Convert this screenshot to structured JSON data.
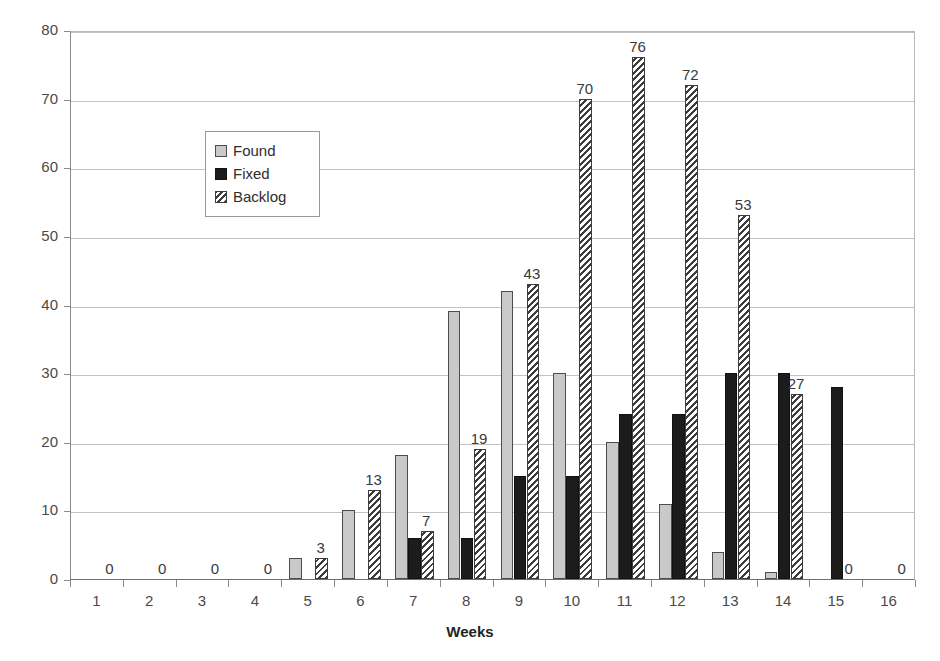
{
  "chart_data": {
    "type": "bar",
    "title": "",
    "xlabel": "Weeks",
    "ylabel": "Number of Defects",
    "categories": [
      "1",
      "2",
      "3",
      "4",
      "5",
      "6",
      "7",
      "8",
      "9",
      "10",
      "11",
      "12",
      "13",
      "14",
      "15",
      "16"
    ],
    "ylim": [
      0,
      80
    ],
    "yticks": [
      0,
      10,
      20,
      30,
      40,
      50,
      60,
      70,
      80
    ],
    "grid": true,
    "legend_position": "upper-left-inside",
    "series": [
      {
        "name": "Found",
        "color": "#c9c9c9",
        "pattern": "solid-light",
        "values": [
          0,
          0,
          0,
          0,
          3,
          10,
          18,
          39,
          42,
          30,
          20,
          11,
          4,
          1,
          0,
          0
        ]
      },
      {
        "name": "Fixed",
        "color": "#1c1c1c",
        "pattern": "solid-dark",
        "values": [
          0,
          0,
          0,
          0,
          0,
          0,
          6,
          6,
          15,
          15,
          24,
          24,
          30,
          30,
          28,
          0
        ]
      },
      {
        "name": "Backlog",
        "color": "#3c3c3c",
        "pattern": "diagonal-hatch",
        "values": [
          0,
          0,
          0,
          0,
          3,
          13,
          7,
          19,
          43,
          70,
          76,
          72,
          53,
          27,
          0,
          0
        ]
      }
    ],
    "annotations": [
      {
        "category": "1",
        "text": "0",
        "series": "Backlog"
      },
      {
        "category": "2",
        "text": "0",
        "series": "Backlog"
      },
      {
        "category": "3",
        "text": "0",
        "series": "Backlog"
      },
      {
        "category": "4",
        "text": "0",
        "series": "Backlog"
      },
      {
        "category": "5",
        "text": "3",
        "series": "Backlog"
      },
      {
        "category": "6",
        "text": "13",
        "series": "Backlog"
      },
      {
        "category": "7",
        "text": "7",
        "series": "Backlog"
      },
      {
        "category": "8",
        "text": "19",
        "series": "Backlog"
      },
      {
        "category": "9",
        "text": "43",
        "series": "Backlog"
      },
      {
        "category": "10",
        "text": "70",
        "series": "Backlog"
      },
      {
        "category": "11",
        "text": "76",
        "series": "Backlog"
      },
      {
        "category": "12",
        "text": "72",
        "series": "Backlog"
      },
      {
        "category": "13",
        "text": "53",
        "series": "Backlog"
      },
      {
        "category": "14",
        "text": "27",
        "series": "Backlog"
      },
      {
        "category": "15",
        "text": "0",
        "series": "Backlog"
      },
      {
        "category": "16",
        "text": "0",
        "series": "Backlog"
      }
    ]
  },
  "legend": {
    "items": [
      {
        "label": "Found"
      },
      {
        "label": "Fixed"
      },
      {
        "label": "Backlog"
      }
    ]
  }
}
